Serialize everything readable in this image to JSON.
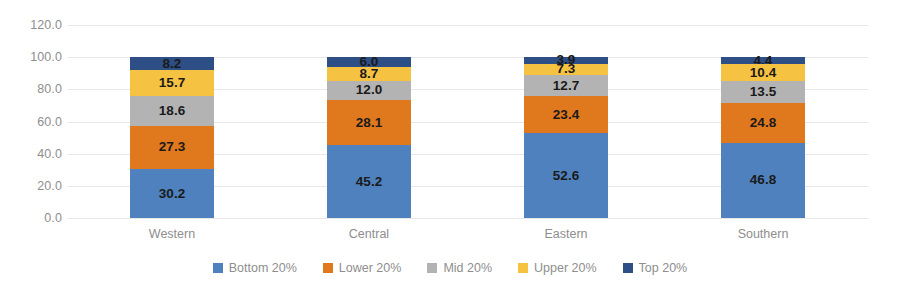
{
  "chart_data": {
    "type": "bar",
    "subtype": "stacked-column-100",
    "title": "",
    "xlabel": "",
    "ylabel": "",
    "categories": [
      "Western",
      "Central",
      "Eastern",
      "Southern"
    ],
    "series": [
      {
        "name": "Bottom 20%",
        "color": "#4E81BD",
        "values": [
          30.2,
          45.2,
          52.6,
          46.8
        ]
      },
      {
        "name": "Lower 20%",
        "color": "#E0781E",
        "values": [
          27.3,
          28.1,
          23.4,
          24.8
        ]
      },
      {
        "name": "Mid 20%",
        "color": "#B3B3B3",
        "values": [
          18.6,
          12.0,
          12.7,
          13.5
        ]
      },
      {
        "name": "Upper 20%",
        "color": "#F6C game",
        "values": [
          15.7,
          8.7,
          7.3,
          10.4
        ]
      },
      {
        "name": "Top 20%",
        "color": "#2E4E86",
        "values": [
          8.2,
          6.0,
          3.9,
          4.4
        ]
      }
    ],
    "ylim": [
      0,
      120
    ],
    "yticks": [
      "0.0",
      "20.0",
      "40.0",
      "60.0",
      "80.0",
      "100.0",
      "120.0"
    ],
    "ytick_values": [
      0,
      20,
      40,
      60,
      80,
      100,
      120
    ],
    "grid": true,
    "legend_position": "bottom",
    "axis_label_color": "#8E8E8E",
    "gridline_color": "#E8E8E8",
    "data_label_color": "#1A1A1A"
  }
}
